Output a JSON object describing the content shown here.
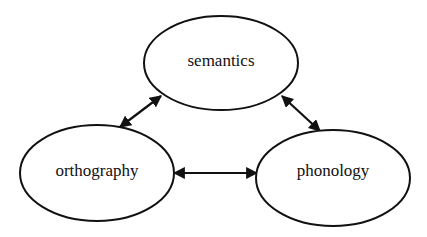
{
  "diagram": {
    "type": "triangular network of bidirectional links",
    "colors": {
      "stroke": "#111111",
      "background": "#ffffff",
      "text": "#111111"
    },
    "nodes": [
      {
        "id": "semantics",
        "label": "semantics",
        "cx": 221,
        "cy": 63,
        "rx": 77,
        "ry": 47
      },
      {
        "id": "orthography",
        "label": "orthography",
        "cx": 97,
        "cy": 173,
        "rx": 77,
        "ry": 48
      },
      {
        "id": "phonology",
        "label": "phonology",
        "cx": 333,
        "cy": 178,
        "rx": 77,
        "ry": 48
      }
    ],
    "edges": [
      {
        "from": "semantics",
        "to": "orthography",
        "direction": "bidirectional"
      },
      {
        "from": "semantics",
        "to": "phonology",
        "direction": "bidirectional"
      },
      {
        "from": "orthography",
        "to": "phonology",
        "direction": "bidirectional"
      }
    ]
  }
}
